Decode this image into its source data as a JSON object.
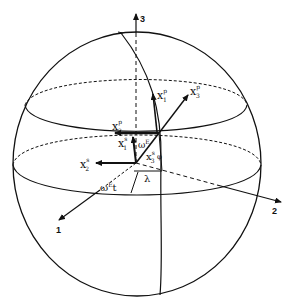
{
  "diagram": {
    "type": "celestial-sphere coordinate diagram",
    "axes": [
      {
        "id": "axis-1",
        "label": "1"
      },
      {
        "id": "axis-2",
        "label": "2"
      },
      {
        "id": "axis-3",
        "label": "3"
      }
    ],
    "vectors": {
      "x1p": {
        "base": "x",
        "sub": "1",
        "sup": "p"
      },
      "x2p": {
        "base": "x",
        "sub": "2",
        "sup": "p"
      },
      "x3p": {
        "base": "x",
        "sub": "3",
        "sup": "p"
      },
      "x1s": {
        "base": "x",
        "sub": "1",
        "sup": "s"
      },
      "x2s": {
        "base": "x",
        "sub": "2",
        "sup": "s"
      },
      "x3s": {
        "base": "x",
        "sub": "3",
        "sup": "s"
      }
    },
    "angles": {
      "omega_t_small": {
        "base": "ω",
        "sup": "E",
        "tail": "t"
      },
      "omega_t_bottom": {
        "base": "ω",
        "sup": "E",
        "tail": "t"
      },
      "lambda": "λ",
      "phi": "φ"
    },
    "colors": {
      "ink": "#111111",
      "background": "#ffffff"
    }
  }
}
